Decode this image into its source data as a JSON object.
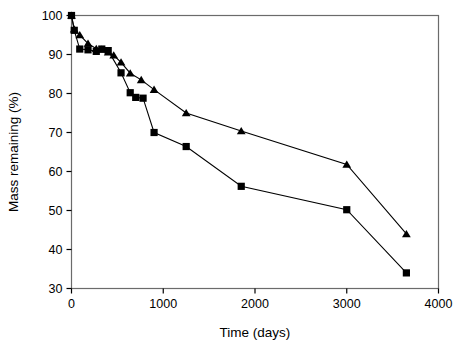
{
  "chart_data": {
    "type": "line",
    "title": "",
    "xlabel": "Time (days)",
    "ylabel": "Mass remaining (%)",
    "xlim": [
      0,
      4000
    ],
    "ylim": [
      30,
      100
    ],
    "xticks": [
      0,
      1000,
      2000,
      3000,
      4000
    ],
    "yticks": [
      30,
      40,
      50,
      60,
      70,
      80,
      90,
      100
    ],
    "grid": false,
    "legend": "none",
    "frame": "full-box",
    "series": [
      {
        "name": "triangle-series",
        "marker": "triangle",
        "color": "#000000",
        "points": [
          {
            "x": 0,
            "y": 100.0
          },
          {
            "x": 30,
            "y": 96.5
          },
          {
            "x": 90,
            "y": 95.0
          },
          {
            "x": 180,
            "y": 92.8
          },
          {
            "x": 270,
            "y": 91.5
          },
          {
            "x": 330,
            "y": 91.3
          },
          {
            "x": 400,
            "y": 90.6
          },
          {
            "x": 460,
            "y": 89.8
          },
          {
            "x": 540,
            "y": 88.0
          },
          {
            "x": 640,
            "y": 85.2
          },
          {
            "x": 760,
            "y": 83.5
          },
          {
            "x": 900,
            "y": 81.0
          },
          {
            "x": 1250,
            "y": 75.0
          },
          {
            "x": 1850,
            "y": 70.4
          },
          {
            "x": 3000,
            "y": 61.8
          },
          {
            "x": 3650,
            "y": 44.0
          }
        ]
      },
      {
        "name": "square-series",
        "marker": "square",
        "color": "#000000",
        "points": [
          {
            "x": 0,
            "y": 100.0
          },
          {
            "x": 30,
            "y": 96.2
          },
          {
            "x": 90,
            "y": 91.4
          },
          {
            "x": 180,
            "y": 91.2
          },
          {
            "x": 270,
            "y": 90.8
          },
          {
            "x": 330,
            "y": 91.4
          },
          {
            "x": 400,
            "y": 91.0
          },
          {
            "x": 540,
            "y": 85.3
          },
          {
            "x": 640,
            "y": 80.2
          },
          {
            "x": 700,
            "y": 79.0
          },
          {
            "x": 780,
            "y": 78.8
          },
          {
            "x": 900,
            "y": 70.0
          },
          {
            "x": 1250,
            "y": 66.4
          },
          {
            "x": 1850,
            "y": 56.2
          },
          {
            "x": 3000,
            "y": 50.2
          },
          {
            "x": 3650,
            "y": 34.0
          }
        ]
      }
    ]
  }
}
